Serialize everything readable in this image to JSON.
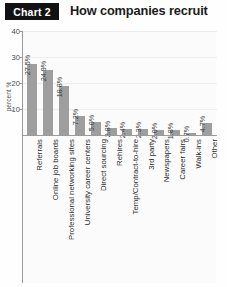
{
  "badge": {
    "label": "Chart 2"
  },
  "header": {
    "title": "How companies recruit"
  },
  "chart_data": {
    "type": "bar",
    "title": "How companies recruit",
    "xlabel": "",
    "ylabel": "percent %",
    "ylim": [
      0,
      40
    ],
    "yticks": [
      "40",
      "30",
      "20",
      "10"
    ],
    "ytick_values": [
      40,
      30,
      20,
      10
    ],
    "grid": true,
    "legend": "none",
    "orientation": "vertical",
    "bar_color": "#9e9e9e",
    "categories": [
      "Referrals",
      "Online job boards",
      "Professional networking sites",
      "University career centers",
      "Direct sourcing",
      "Rehires",
      "Temp/Contract-to-hire",
      "3rd party",
      "Newspapers",
      "Career fairs",
      "Walk-ins",
      "Other"
    ],
    "values": [
      27.5,
      24.9,
      18.8,
      7.2,
      5.0,
      2.8,
      2.4,
      2.3,
      2.0,
      1.8,
      0.7,
      4.7
    ],
    "data_labels": [
      "27.5%",
      "24.9%",
      "18.8%",
      "7.2%",
      "5.0%",
      "2.8%",
      "2.4%",
      "2.3%",
      "2.0%",
      "1.8%",
      "0.7%",
      "4.7%"
    ]
  }
}
